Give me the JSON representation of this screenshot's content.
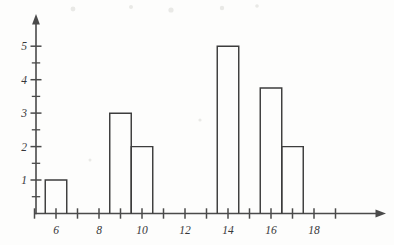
{
  "figure": {
    "kind": "scanned-histogram-figure",
    "background_color": "#fdfdfc",
    "ink_color": "#4a4a4a",
    "bar_stroke_color": "#3d3d3d"
  },
  "chart_data": {
    "type": "bar",
    "title": "",
    "subtitle": "",
    "xlabel": "",
    "ylabel": "",
    "categories": [
      6,
      9,
      10,
      14,
      16,
      17
    ],
    "values": [
      1,
      3,
      2,
      5,
      3.75,
      2
    ],
    "bar_width": 1,
    "bars": [
      {
        "center": 6,
        "left": 5.5,
        "right": 6.5,
        "height": 1
      },
      {
        "center": 9,
        "left": 8.5,
        "right": 9.5,
        "height": 3
      },
      {
        "center": 10,
        "left": 9.5,
        "right": 10.5,
        "height": 2
      },
      {
        "center": 14,
        "left": 13.5,
        "right": 14.5,
        "height": 5
      },
      {
        "center": 16,
        "left": 15.5,
        "right": 16.5,
        "height": 3.75
      },
      {
        "center": 17,
        "left": 16.5,
        "right": 17.5,
        "height": 2
      }
    ],
    "xlim": [
      4.6,
      19.4
    ],
    "ylim": [
      0,
      5.6
    ],
    "x_ticks_major": [
      5,
      6,
      7,
      8,
      9,
      10,
      11,
      12,
      13,
      14,
      15,
      16,
      17,
      18,
      19
    ],
    "x_tick_labels": [
      {
        "value": 6,
        "label": "6"
      },
      {
        "value": 8,
        "label": "8"
      },
      {
        "value": 10,
        "label": "10"
      },
      {
        "value": 12,
        "label": "12"
      },
      {
        "value": 14,
        "label": "14"
      },
      {
        "value": 16,
        "label": "16"
      },
      {
        "value": 18,
        "label": "18"
      }
    ],
    "y_ticks_major": [
      1,
      2,
      3,
      4,
      5
    ],
    "y_ticks_minor": [
      0.5,
      1.5,
      2.5,
      3.5,
      4.5
    ],
    "y_tick_labels": [
      {
        "value": 1,
        "label": "1"
      },
      {
        "value": 2,
        "label": "2"
      },
      {
        "value": 3,
        "label": "3"
      },
      {
        "value": 4,
        "label": "4"
      },
      {
        "value": 5,
        "label": "5"
      }
    ],
    "grid": false,
    "legend": null,
    "annotations": [],
    "axes_style": {
      "x_axis_arrow": true,
      "y_axis_arrow": true,
      "bars_filled": false
    }
  }
}
